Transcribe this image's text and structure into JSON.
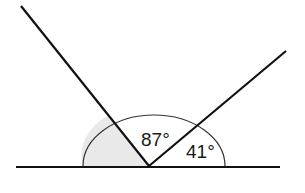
{
  "diagram": {
    "type": "angles-on-a-straight-line",
    "angles": [
      {
        "id": "unknown",
        "label": "",
        "shaded": true
      },
      {
        "id": "middle",
        "label": "87°",
        "shaded": false
      },
      {
        "id": "right",
        "label": "41°",
        "shaded": false
      }
    ],
    "colors": {
      "line": "#111111",
      "arc": "#333333",
      "shade": "#e9e9e9",
      "background": "#ffffff"
    }
  }
}
